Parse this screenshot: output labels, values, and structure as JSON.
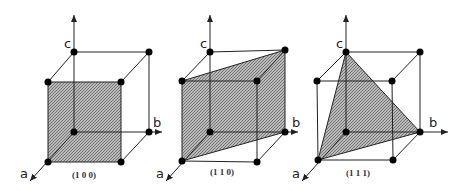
{
  "colors": {
    "line": "#222222",
    "shade": "#9a9a9a",
    "atom": "#000000"
  },
  "figures": [
    {
      "axes": {
        "a": "a",
        "b": "b",
        "c": "c"
      },
      "plane": "(1 0 0)"
    },
    {
      "axes": {
        "a": "a",
        "b": "b",
        "c": "c"
      },
      "plane": "(1 1 0)"
    },
    {
      "axes": {
        "a": "a",
        "b": "b",
        "c": "c"
      },
      "plane": "(1 1 1)"
    }
  ]
}
